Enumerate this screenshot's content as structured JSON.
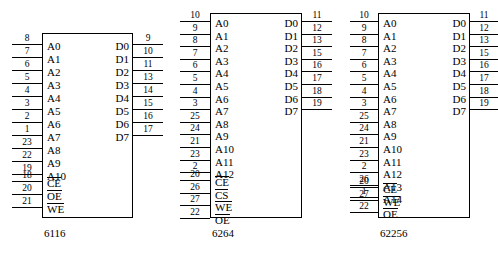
{
  "diagram": {
    "chips": [
      {
        "name": "6116",
        "address_pins": [
          {
            "label": "A0",
            "pin": "8"
          },
          {
            "label": "A1",
            "pin": "7"
          },
          {
            "label": "A2",
            "pin": "6"
          },
          {
            "label": "A3",
            "pin": "5"
          },
          {
            "label": "A4",
            "pin": "4"
          },
          {
            "label": "A5",
            "pin": "3"
          },
          {
            "label": "A6",
            "pin": "2"
          },
          {
            "label": "A7",
            "pin": "1"
          },
          {
            "label": "A8",
            "pin": "23"
          },
          {
            "label": "A9",
            "pin": "22"
          },
          {
            "label": "A10",
            "pin": "19"
          }
        ],
        "control_pins": [
          {
            "label": "CE",
            "pin": "18",
            "overline": true
          },
          {
            "label": "OE",
            "pin": "20",
            "overline": true
          },
          {
            "label": "WE",
            "pin": "21",
            "overline": true
          }
        ],
        "data_pins": [
          {
            "label": "D0",
            "pin": "9"
          },
          {
            "label": "D1",
            "pin": "10"
          },
          {
            "label": "D2",
            "pin": "11"
          },
          {
            "label": "D3",
            "pin": "13"
          },
          {
            "label": "D4",
            "pin": "14"
          },
          {
            "label": "D5",
            "pin": "15"
          },
          {
            "label": "D6",
            "pin": "16"
          },
          {
            "label": "D7",
            "pin": "17"
          }
        ]
      },
      {
        "name": "6264",
        "address_pins": [
          {
            "label": "A0",
            "pin": "10"
          },
          {
            "label": "A1",
            "pin": "9"
          },
          {
            "label": "A2",
            "pin": "8"
          },
          {
            "label": "A3",
            "pin": "7"
          },
          {
            "label": "A4",
            "pin": "6"
          },
          {
            "label": "A5",
            "pin": "5"
          },
          {
            "label": "A6",
            "pin": "4"
          },
          {
            "label": "A7",
            "pin": "3"
          },
          {
            "label": "A8",
            "pin": "25"
          },
          {
            "label": "A9",
            "pin": "24"
          },
          {
            "label": "A10",
            "pin": "21"
          },
          {
            "label": "A11",
            "pin": "23"
          },
          {
            "label": "A12",
            "pin": "2"
          }
        ],
        "control_pins": [
          {
            "label": "CE",
            "pin": "20",
            "overline": true
          },
          {
            "label": "CS",
            "pin": "26",
            "overline": true
          },
          {
            "label": "WE",
            "pin": "27",
            "overline": true
          },
          {
            "label": "OE",
            "pin": "22",
            "overline": true
          }
        ],
        "data_pins": [
          {
            "label": "D0",
            "pin": "11"
          },
          {
            "label": "D1",
            "pin": "12"
          },
          {
            "label": "D2",
            "pin": "13"
          },
          {
            "label": "D3",
            "pin": "15"
          },
          {
            "label": "D4",
            "pin": "16"
          },
          {
            "label": "D5",
            "pin": "17"
          },
          {
            "label": "D6",
            "pin": "18"
          },
          {
            "label": "D7",
            "pin": "19"
          }
        ]
      },
      {
        "name": "62256",
        "address_pins": [
          {
            "label": "A0",
            "pin": "10"
          },
          {
            "label": "A1",
            "pin": "9"
          },
          {
            "label": "A2",
            "pin": "8"
          },
          {
            "label": "A3",
            "pin": "7"
          },
          {
            "label": "A4",
            "pin": "6"
          },
          {
            "label": "A5",
            "pin": "5"
          },
          {
            "label": "A6",
            "pin": "4"
          },
          {
            "label": "A7",
            "pin": "3"
          },
          {
            "label": "A8",
            "pin": "25"
          },
          {
            "label": "A9",
            "pin": "24"
          },
          {
            "label": "A10",
            "pin": "21"
          },
          {
            "label": "A11",
            "pin": "23"
          },
          {
            "label": "A12",
            "pin": "2"
          },
          {
            "label": "A13",
            "pin": "26"
          },
          {
            "label": "A14",
            "pin": "1"
          }
        ],
        "control_pins": [
          {
            "label": "CE",
            "pin": "20",
            "overline": true
          },
          {
            "label": "WE",
            "pin": "27",
            "overline": true
          },
          {
            "label": "OE",
            "pin": "22",
            "overline": true
          }
        ],
        "data_pins": [
          {
            "label": "D0",
            "pin": "11"
          },
          {
            "label": "D1",
            "pin": "12"
          },
          {
            "label": "D2",
            "pin": "13"
          },
          {
            "label": "D3",
            "pin": "15"
          },
          {
            "label": "D4",
            "pin": "16"
          },
          {
            "label": "D5",
            "pin": "17"
          },
          {
            "label": "D6",
            "pin": "18"
          },
          {
            "label": "D7",
            "pin": "19"
          }
        ]
      }
    ]
  }
}
